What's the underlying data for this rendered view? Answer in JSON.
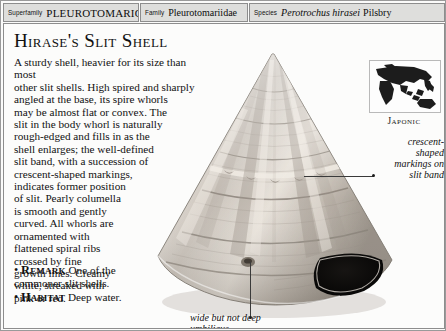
{
  "taxonomy": [
    {
      "key": "Superfamily",
      "value": "PLEUROTOMARIOIDEA",
      "style": "smallcaps"
    },
    {
      "key": "Family",
      "value": "Pleurotomariidae",
      "style": "roman"
    },
    {
      "key": "Species",
      "value_italic": "Perotrochus hirasei",
      "value_author": "Pilsbry",
      "style": "italic-author"
    }
  ],
  "title": "Hirase's Slit Shell",
  "description": {
    "lines": [
      "A sturdy shell, heavier for its size than most",
      "other slit shells. High spired and sharply",
      "angled at the base, its spire whorls",
      "may be almost flat or convex. The",
      "slit in the body whorl is naturally",
      "rough-edged and fills in as the",
      "shell enlarges; the well-defined",
      "slit band, with a succession of",
      "crescent-shaped markings,",
      "indicates former position",
      "of slit. Pearly columella",
      "is smooth and gently",
      "curved. All whorls are",
      "ornamented with",
      "flattened spiral ribs",
      "crossed by fine",
      "growth lines. Creamy",
      "white, streaked with",
      "pink or red."
    ]
  },
  "facts": [
    {
      "bullet": "•",
      "keyword": "Remark",
      "text": " One of the commoner slit shells."
    },
    {
      "bullet": "•",
      "keyword": "Habitat",
      "text": " Deep water."
    }
  ],
  "map": {
    "region_label": "Japonic"
  },
  "annotations": [
    {
      "id": "slit-band",
      "text": "crescent-shaped markings on slit band"
    },
    {
      "id": "umbilicus",
      "text": "wide but not deep umbilicus"
    }
  ],
  "colors": {
    "page_background": "#fcfcfb",
    "header_cell": "#dededc",
    "rule": "#8d8d8d",
    "text": "#111111",
    "map_land": "#1c1c1c"
  }
}
